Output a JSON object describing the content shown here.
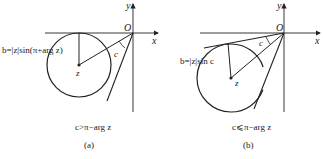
{
  "panels": [
    {
      "id": "a",
      "axis_x_label": "x",
      "axis_y_label": "y",
      "origin_label": "O",
      "center_label": "z",
      "angle_label": "c",
      "radius_label": "b=|z|sin(π+arg z)",
      "condition": "c>π−arg z",
      "caption": "(a)"
    },
    {
      "id": "b",
      "axis_x_label": "x",
      "axis_y_label": "y",
      "origin_label": "O",
      "center_label": "z",
      "angle_label": "c",
      "radius_label": "b=|z|sin c",
      "condition": "c⩽π−arg z",
      "caption": "(b)"
    }
  ],
  "colors": {
    "line": "#222222",
    "background": "#ffffff"
  }
}
